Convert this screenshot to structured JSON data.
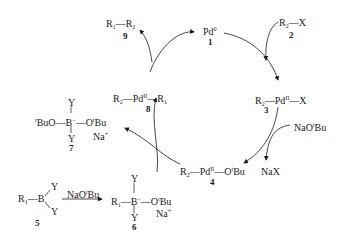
{
  "compounds": {
    "c1": {
      "label": "Pd",
      "sup": "0",
      "number": "1"
    },
    "c2": {
      "r": "R",
      "rsub": "2",
      "rest": "—X",
      "number": "2"
    },
    "c3": {
      "r": "R",
      "rsub": "2",
      "pd": "—Pd",
      "ox": "II",
      "rest": "—X",
      "number": "3"
    },
    "c4": {
      "r": "R",
      "rsub": "2",
      "pd": "—Pd",
      "ox": "II",
      "rest": "—O",
      "tb": "t",
      "bu": "Bu",
      "number": "4"
    },
    "c5": {
      "r": "R",
      "rsub": "1",
      "b": "—B",
      "y1": "Y",
      "y2": "Y",
      "number": "5"
    },
    "c6": {
      "r": "R",
      "rsub": "1",
      "b": "—B",
      "charge": "−",
      "o": "—O",
      "tb": "t",
      "bu": "Bu",
      "y1": "Y",
      "y2": "Y",
      "na": "Na",
      "naplus": "+",
      "number": "6"
    },
    "c7": {
      "tb": "t",
      "left": "BuO—B",
      "charge": "−",
      "o": "—O",
      "tb2": "t",
      "bu": "Bu",
      "y1": "Y",
      "y2": "Y",
      "na": "Na",
      "naplus": "+",
      "number": "7"
    },
    "c8": {
      "r": "R",
      "rsub": "2",
      "pd": "—Pd",
      "ox": "II",
      "r2": "—R",
      "r2sub": "1",
      "number": "8"
    },
    "c9": {
      "r": "R",
      "rsub": "1",
      "r2": "—R",
      "r2sub": "2",
      "number": "9"
    }
  },
  "reagents": {
    "naotbu_top": {
      "a": "NaO",
      "t": "t",
      "b": "Bu"
    },
    "nax": "NaX",
    "naotbu_bottom": {
      "a": "NaO",
      "t": "t",
      "b": "Bu"
    }
  },
  "colors": {
    "ink": "#1a1a1a",
    "background": "#ffffff"
  }
}
